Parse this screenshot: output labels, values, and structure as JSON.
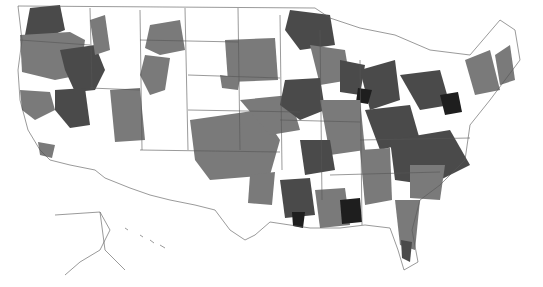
{
  "map": {
    "title": "",
    "region": "United States (contiguous, Alaska, Hawaii)",
    "colors": {
      "background": "#ffffff",
      "border": "#555555",
      "none": "#ffffff",
      "medium": "#7a7a7a",
      "high": "#4a4a4a",
      "highest": "#1e1e1e"
    },
    "shading_levels": [
      "none",
      "medium",
      "high",
      "highest"
    ]
  },
  "legend": {
    "items": [
      {
        "label": "age",
        "shade": "high"
      },
      {
        "label": "age",
        "shade": "medium"
      }
    ]
  }
}
